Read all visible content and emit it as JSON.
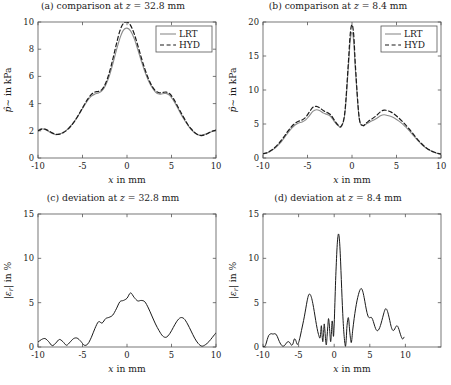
{
  "figure": {
    "background": "#ffffff",
    "foreground": "#1a1a1a",
    "panel_count": 4
  },
  "series_styles": {
    "LRT": {
      "color": "#8c8c8c",
      "dash": "none",
      "width": 1.1
    },
    "HYD": {
      "color": "#1a1a1a",
      "dash": "4,2.6",
      "width": 1.2
    },
    "deviation": {
      "color": "#1a1a1a",
      "dash": "none",
      "width": 1.0
    }
  },
  "legend": {
    "entries": [
      {
        "label": "LRT",
        "style": "LRT"
      },
      {
        "label": "HYD",
        "style": "HYD"
      }
    ],
    "position": "top-right"
  },
  "chart_data": [
    {
      "id": "panel-a",
      "type": "line",
      "title": "(a) comparison at z = 32.8 mm",
      "title_prefix": "(a) comparison at ",
      "title_var": "z",
      "title_suffix": " = 32.8 mm",
      "xlabel": "x in mm",
      "ylabel": "p̂∼ in kPa",
      "ylabel_parts": {
        "sym": "p̂∼",
        "rest": " in kPa"
      },
      "xlim": [
        -10,
        10
      ],
      "ylim": [
        0,
        10
      ],
      "xticks": [
        -10,
        -5,
        0,
        5,
        10
      ],
      "xticklabels": [
        "-10",
        "-5",
        "0",
        "5",
        "10"
      ],
      "yticks": [
        0,
        2,
        4,
        6,
        8,
        10
      ],
      "yticklabels": [
        "0",
        "2",
        "4",
        "6",
        "8",
        "10"
      ],
      "grid": false,
      "legend": true,
      "x": [
        -10,
        -9.6,
        -9.2,
        -8.8,
        -8.4,
        -8,
        -7.6,
        -7.2,
        -6.8,
        -6.4,
        -6,
        -5.6,
        -5.2,
        -4.8,
        -4.4,
        -4,
        -3.6,
        -3.2,
        -2.8,
        -2.4,
        -2,
        -1.6,
        -1.2,
        -0.8,
        -0.4,
        0,
        0.4,
        0.8,
        1.2,
        1.6,
        2,
        2.4,
        2.8,
        3.2,
        3.6,
        4,
        4.4,
        4.8,
        5.2,
        5.6,
        6,
        6.4,
        6.8,
        7.2,
        7.6,
        8,
        8.4,
        8.8,
        9.2,
        9.6,
        10
      ],
      "series": [
        {
          "name": "LRT",
          "values": [
            2.05,
            2.15,
            2.1,
            1.95,
            1.8,
            1.72,
            1.75,
            1.88,
            2.05,
            2.3,
            2.62,
            3.0,
            3.42,
            3.85,
            4.25,
            4.55,
            4.7,
            4.78,
            4.95,
            5.35,
            6.0,
            6.9,
            7.9,
            8.8,
            9.4,
            9.55,
            9.35,
            8.8,
            8.0,
            7.15,
            6.35,
            5.7,
            5.2,
            4.85,
            4.7,
            4.72,
            4.75,
            4.6,
            4.25,
            3.8,
            3.3,
            2.85,
            2.45,
            2.1,
            1.85,
            1.7,
            1.68,
            1.75,
            1.85,
            1.95,
            2.0
          ]
        },
        {
          "name": "HYD",
          "values": [
            2.0,
            2.12,
            2.12,
            2.0,
            1.85,
            1.75,
            1.75,
            1.85,
            2.02,
            2.28,
            2.6,
            3.0,
            3.45,
            3.92,
            4.35,
            4.68,
            4.85,
            4.9,
            5.05,
            5.5,
            6.25,
            7.25,
            8.35,
            9.35,
            9.9,
            10.0,
            9.75,
            9.15,
            8.3,
            7.4,
            6.55,
            5.85,
            5.3,
            4.95,
            4.8,
            4.82,
            4.85,
            4.72,
            4.38,
            3.92,
            3.42,
            2.95,
            2.5,
            2.15,
            1.88,
            1.7,
            1.65,
            1.72,
            1.85,
            1.98,
            2.05
          ]
        }
      ]
    },
    {
      "id": "panel-b",
      "type": "line",
      "title": "(b) comparison at z = 8.4 mm",
      "title_prefix": "(b) comparison at ",
      "title_var": "z",
      "title_suffix": " = 8.4 mm",
      "xlabel": "x in mm",
      "ylabel": "p̂∼ in kPa",
      "ylabel_parts": {
        "sym": "p̂∼",
        "rest": " in kPa"
      },
      "xlim": [
        -10,
        10
      ],
      "ylim": [
        0,
        20
      ],
      "xticks": [
        -10,
        -5,
        0,
        5,
        10
      ],
      "xticklabels": [
        "-10",
        "-5",
        "0",
        "5",
        "10"
      ],
      "yticks": [
        0,
        5,
        10,
        15,
        20
      ],
      "yticklabels": [
        "0",
        "5",
        "10",
        "15",
        "20"
      ],
      "grid": false,
      "legend": true,
      "x": [
        -10,
        -9.6,
        -9.2,
        -8.8,
        -8.4,
        -8,
        -7.6,
        -7.2,
        -6.8,
        -6.4,
        -6,
        -5.6,
        -5.2,
        -4.8,
        -4.4,
        -4,
        -3.6,
        -3.2,
        -2.8,
        -2.4,
        -2,
        -1.6,
        -1.2,
        -0.8,
        -0.4,
        -0.2,
        0,
        0.2,
        0.4,
        0.8,
        1.2,
        1.6,
        2,
        2.4,
        2.8,
        3.2,
        3.6,
        4,
        4.4,
        4.8,
        5.2,
        5.6,
        6,
        6.4,
        6.8,
        7.2,
        7.6,
        8,
        8.4,
        8.8,
        9.2,
        9.6,
        10
      ],
      "series": [
        {
          "name": "LRT",
          "values": [
            0.6,
            0.7,
            0.95,
            1.3,
            1.75,
            2.3,
            3.0,
            3.7,
            4.35,
            4.85,
            5.15,
            5.3,
            5.6,
            6.2,
            6.85,
            7.1,
            6.95,
            6.6,
            6.4,
            6.1,
            5.4,
            4.8,
            4.6,
            6.5,
            13.5,
            17.2,
            18.5,
            17.0,
            12.6,
            5.9,
            4.75,
            5.0,
            5.3,
            5.55,
            5.85,
            6.2,
            6.35,
            6.25,
            6.1,
            5.85,
            5.5,
            5.1,
            4.6,
            4.05,
            3.45,
            2.85,
            2.3,
            1.8,
            1.4,
            1.1,
            0.85,
            0.68,
            0.55
          ]
        },
        {
          "name": "HYD",
          "values": [
            0.62,
            0.75,
            1.02,
            1.4,
            1.9,
            2.5,
            3.2,
            3.95,
            4.6,
            5.1,
            5.4,
            5.6,
            6.0,
            6.75,
            7.45,
            7.6,
            7.35,
            6.95,
            6.7,
            6.35,
            5.6,
            4.9,
            4.7,
            6.8,
            14.2,
            18.2,
            19.6,
            18.0,
            13.2,
            6.0,
            4.8,
            5.15,
            5.55,
            5.9,
            6.3,
            6.8,
            7.05,
            6.95,
            6.75,
            6.4,
            5.95,
            5.45,
            4.9,
            4.3,
            3.65,
            3.0,
            2.4,
            1.88,
            1.45,
            1.12,
            0.88,
            0.7,
            0.58
          ]
        }
      ]
    },
    {
      "id": "panel-c",
      "type": "line",
      "title": "(c) deviation at z = 32.8 mm",
      "title_prefix": "(c) deviation at ",
      "title_var": "z",
      "title_suffix": " = 32.8 mm",
      "xlabel": "x in mm",
      "ylabel": "|εr| in %",
      "ylabel_parts": {
        "sym": "|ε",
        "sub": "r",
        "rest": "| in %"
      },
      "xlim": [
        -10,
        10
      ],
      "ylim": [
        0,
        15
      ],
      "xticks": [
        -10,
        -5,
        0,
        5,
        10
      ],
      "xticklabels": [
        "-10",
        "-5",
        "0",
        "5",
        "10"
      ],
      "yticks": [
        0,
        5,
        10,
        15
      ],
      "yticklabels": [
        "0",
        "5",
        "10",
        "15"
      ],
      "grid": false,
      "legend": false,
      "x": [
        -10,
        -9.6,
        -9.2,
        -8.8,
        -8.4,
        -8,
        -7.6,
        -7.2,
        -6.8,
        -6.4,
        -6,
        -5.6,
        -5.2,
        -4.8,
        -4.4,
        -4,
        -3.6,
        -3.2,
        -2.8,
        -2.4,
        -2,
        -1.6,
        -1.2,
        -0.8,
        -0.4,
        0,
        0.4,
        0.8,
        1.2,
        1.6,
        2,
        2.4,
        2.8,
        3.2,
        3.6,
        4,
        4.4,
        4.8,
        5.2,
        5.6,
        6,
        6.4,
        6.8,
        7.2,
        7.6,
        8,
        8.4,
        8.8,
        9.2,
        9.6,
        10
      ],
      "series": [
        {
          "name": "deviation",
          "values": [
            0.55,
            0.85,
            0.95,
            0.6,
            0.15,
            0.45,
            0.85,
            0.6,
            0.2,
            0.55,
            0.95,
            1.0,
            0.65,
            0.2,
            0.35,
            1.1,
            2.1,
            2.85,
            2.7,
            3.2,
            3.35,
            3.6,
            4.3,
            5.1,
            5.25,
            5.5,
            6.1,
            5.6,
            5.2,
            5.25,
            5.1,
            4.4,
            3.5,
            2.6,
            1.85,
            1.25,
            1.1,
            1.5,
            2.2,
            2.9,
            3.3,
            3.2,
            2.6,
            1.8,
            1.0,
            0.4,
            0.1,
            0.25,
            0.6,
            1.1,
            1.6
          ]
        }
      ]
    },
    {
      "id": "panel-d",
      "type": "line",
      "title": "(d) deviation at z = 8.4 mm",
      "title_prefix": "(d) deviation at ",
      "title_var": "z",
      "title_suffix": " = 8.4 mm",
      "xlabel": "x in mm",
      "ylabel": "|εr| in %",
      "ylabel_parts": {
        "sym": "|ε",
        "sub": "r",
        "rest": "| in %"
      },
      "xlim": [
        -10,
        15
      ],
      "ylim": [
        0,
        15
      ],
      "xticks": [
        -10,
        -5,
        0,
        5,
        10
      ],
      "xticklabels": [
        "-10",
        "-5",
        "0",
        "5",
        "10"
      ],
      "yticks": [
        0,
        5,
        10,
        15
      ],
      "yticklabels": [
        "0",
        "5",
        "10",
        "15"
      ],
      "grid": false,
      "legend": false,
      "x": [
        -10,
        -9.8,
        -9.6,
        -9.4,
        -9.2,
        -9,
        -8.8,
        -8.6,
        -8.4,
        -8.2,
        -8,
        -7.8,
        -7.6,
        -7.4,
        -7.2,
        -7,
        -6.8,
        -6.6,
        -6.4,
        -6.2,
        -6,
        -5.8,
        -5.6,
        -5.4,
        -5.2,
        -5,
        -4.8,
        -4.6,
        -4.4,
        -4.2,
        -4,
        -3.8,
        -3.6,
        -3.4,
        -3.2,
        -3,
        -2.8,
        -2.6,
        -2.4,
        -2.2,
        -2,
        -1.9,
        -1.8,
        -1.7,
        -1.6,
        -1.5,
        -1.4,
        -1.3,
        -1.2,
        -1.1,
        -1,
        -0.9,
        -0.8,
        -0.7,
        -0.6,
        -0.5,
        -0.4,
        -0.3,
        -0.2,
        -0.1,
        0,
        0.1,
        0.2,
        0.3,
        0.4,
        0.5,
        0.6,
        0.7,
        0.8,
        0.9,
        1,
        1.1,
        1.2,
        1.3,
        1.4,
        1.5,
        1.6,
        1.7,
        1.8,
        2,
        2.2,
        2.4,
        2.6,
        2.8,
        3,
        3.2,
        3.4,
        3.6,
        3.8,
        4,
        4.2,
        4.4,
        4.6,
        4.8,
        5,
        5.2,
        5.4,
        5.6,
        5.8,
        6,
        6.2,
        6.4,
        6.6,
        6.8,
        7,
        7.2,
        7.4,
        7.6,
        7.8,
        8,
        8.2,
        8.4,
        8.6,
        8.8,
        9,
        9.2,
        9.4,
        9.6,
        9.8,
        10
      ],
      "series": [
        {
          "name": "deviation",
          "values": [
            0.1,
            0.05,
            0.3,
            0.85,
            1.3,
            1.45,
            1.5,
            1.45,
            1.5,
            1.45,
            1.2,
            0.8,
            0.45,
            0.2,
            0.1,
            0.15,
            0.35,
            0.55,
            0.6,
            0.45,
            0.2,
            0.35,
            0.9,
            0.75,
            0.3,
            0.5,
            1.1,
            1.85,
            2.6,
            3.4,
            4.3,
            5.2,
            5.85,
            5.95,
            5.6,
            4.9,
            4.0,
            3.0,
            2.1,
            1.4,
            1.0,
            1.6,
            2.4,
            1.3,
            0.6,
            1.5,
            2.6,
            1.8,
            0.7,
            0.25,
            1.2,
            2.3,
            3.2,
            2.6,
            1.5,
            0.6,
            1.4,
            2.9,
            2.4,
            1.2,
            2.6,
            5.0,
            7.5,
            9.5,
            11.2,
            12.3,
            12.75,
            12.4,
            11.3,
            9.6,
            7.6,
            5.6,
            3.8,
            2.3,
            1.2,
            0.4,
            0.1,
            1.0,
            2.4,
            3.3,
            1.6,
            0.5,
            1.9,
            3.2,
            4.3,
            5.2,
            5.9,
            6.4,
            6.6,
            6.3,
            5.6,
            4.7,
            3.9,
            3.4,
            3.3,
            3.35,
            3.1,
            2.6,
            2.1,
            1.85,
            1.9,
            2.2,
            2.7,
            3.3,
            3.9,
            4.3,
            4.2,
            3.7,
            3.0,
            2.3,
            1.9,
            1.9,
            2.2,
            2.4,
            2.2,
            1.7,
            1.2,
            0.9,
            1.1,
            1.5,
            1.2,
            0.5,
            0.05
          ]
        }
      ]
    }
  ],
  "panel_layout": [
    {
      "id": "panel-a",
      "left": 0,
      "top": 0,
      "width": 226,
      "height": 196
    },
    {
      "id": "panel-b",
      "left": 225,
      "top": 0,
      "width": 226,
      "height": 196
    },
    {
      "id": "panel-c",
      "left": 0,
      "top": 192,
      "width": 226,
      "height": 193
    },
    {
      "id": "panel-d",
      "left": 225,
      "top": 192,
      "width": 226,
      "height": 193
    }
  ]
}
